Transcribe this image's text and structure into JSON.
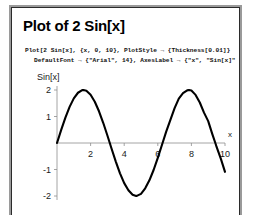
{
  "document": {
    "title": "Plot of 2 Sin[x]",
    "code_lines": [
      "Plot[2 Sin[x], {x, 0, 10}, PlotStyle → {Thickness[0.01]}",
      "DefaultFont → {\"Arial\", 14}, AxesLabel → {\"x\", \"Sin[x]\""
    ]
  },
  "chart_data": {
    "type": "line",
    "title": "",
    "expression": "2 Sin[x]",
    "xlabel": "x",
    "ylabel": "Sin[x]",
    "xlim": [
      0,
      10
    ],
    "ylim": [
      -2,
      2
    ],
    "grid": false,
    "legend": "none",
    "x_ticks": [
      2,
      4,
      6,
      8,
      10
    ],
    "x_tick_labels": [
      "2",
      "4",
      "6",
      "8",
      "10"
    ],
    "y_ticks": [
      2,
      1,
      -1,
      -2
    ],
    "y_tick_labels": [
      "2",
      "1",
      "-1",
      "-2"
    ],
    "series": [
      {
        "name": "2 Sin[x]",
        "color": "#000000",
        "thickness": 0.01,
        "x": [
          0,
          0.25,
          0.5,
          0.75,
          1,
          1.25,
          1.5,
          1.5708,
          1.75,
          2,
          2.25,
          2.5,
          2.75,
          3,
          3.1416,
          3.25,
          3.5,
          3.75,
          4,
          4.25,
          4.5,
          4.7124,
          4.75,
          5,
          5.25,
          5.5,
          5.75,
          6,
          6.2832,
          6.5,
          6.75,
          7,
          7.25,
          7.5,
          7.75,
          7.854,
          8,
          8.25,
          8.5,
          8.75,
          9,
          9.25,
          9.4248,
          9.5,
          9.75,
          10
        ],
        "y": [
          0,
          0.4948,
          0.9589,
          1.3639,
          1.6829,
          1.8964,
          1.995,
          2,
          1.9681,
          1.8186,
          1.5576,
          1.1969,
          0.7632,
          0.2822,
          0,
          -0.2174,
          -0.7015,
          -1.1451,
          -1.5136,
          -1.7813,
          -1.9552,
          -2,
          -1.9951,
          -1.9178,
          -1.7079,
          -1.4082,
          -1.0182,
          -0.5588,
          0,
          0.4296,
          0.8759,
          1.314,
          1.6774,
          1.8784,
          1.9866,
          2,
          1.9787,
          1.8154,
          1.529,
          1.1462,
          0.8242,
          0.3281,
          0,
          -0.15,
          -0.591,
          -1.088
        ]
      }
    ]
  }
}
